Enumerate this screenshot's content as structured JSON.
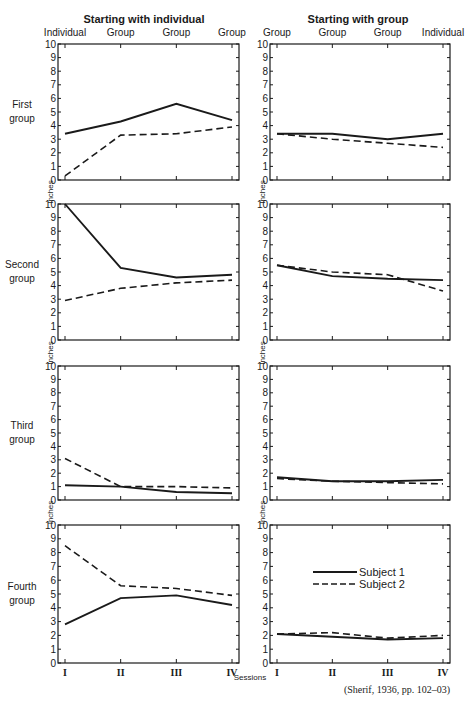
{
  "headers": {
    "left": "Starting with individual",
    "right": "Starting with group"
  },
  "columns": {
    "left": [
      "Individual",
      "Group",
      "Group",
      "Group"
    ],
    "right": [
      "Group",
      "Group",
      "Group",
      "Individual"
    ]
  },
  "group_labels": [
    [
      "First",
      "group"
    ],
    [
      "Second",
      "group"
    ],
    [
      "Third",
      "group"
    ],
    [
      "Fourth",
      "group"
    ]
  ],
  "y_axis_label": "Inches",
  "x_axis_label": "Sessions",
  "x_ticks": [
    "I",
    "II",
    "III",
    "IV"
  ],
  "y_ticks": [
    "0",
    "1",
    "2",
    "3",
    "4",
    "5",
    "6",
    "7",
    "8",
    "9",
    "10"
  ],
  "legend": {
    "subject1": "Subject 1",
    "subject2": "Subject 2"
  },
  "citation": "(Sherif, 1936, pp. 102–03)",
  "chart_data": [
    {
      "type": "line",
      "title": "First group — Starting with individual",
      "categories": [
        "I",
        "II",
        "III",
        "IV"
      ],
      "xlabel": "Sessions",
      "ylabel": "Inches",
      "ylim": [
        0,
        10
      ],
      "series": [
        {
          "name": "Subject 1",
          "values": [
            3.4,
            4.3,
            5.6,
            4.4
          ]
        },
        {
          "name": "Subject 2",
          "values": [
            0.3,
            3.3,
            3.4,
            3.9
          ]
        }
      ]
    },
    {
      "type": "line",
      "title": "First group — Starting with group",
      "categories": [
        "I",
        "II",
        "III",
        "IV"
      ],
      "xlabel": "Sessions",
      "ylabel": "Inches",
      "ylim": [
        0,
        10
      ],
      "series": [
        {
          "name": "Subject 1",
          "values": [
            3.4,
            3.4,
            3.0,
            3.4
          ]
        },
        {
          "name": "Subject 2",
          "values": [
            3.4,
            3.0,
            2.7,
            2.4
          ]
        }
      ]
    },
    {
      "type": "line",
      "title": "Second group — Starting with individual",
      "categories": [
        "I",
        "II",
        "III",
        "IV"
      ],
      "xlabel": "Sessions",
      "ylabel": "Inches",
      "ylim": [
        0,
        10
      ],
      "series": [
        {
          "name": "Subject 1",
          "values": [
            10.0,
            5.3,
            4.6,
            4.8
          ]
        },
        {
          "name": "Subject 2",
          "values": [
            2.9,
            3.8,
            4.2,
            4.4
          ]
        }
      ]
    },
    {
      "type": "line",
      "title": "Second group — Starting with group",
      "categories": [
        "I",
        "II",
        "III",
        "IV"
      ],
      "xlabel": "Sessions",
      "ylabel": "Inches",
      "ylim": [
        0,
        10
      ],
      "series": [
        {
          "name": "Subject 1",
          "values": [
            5.5,
            4.7,
            4.5,
            4.4
          ]
        },
        {
          "name": "Subject 2",
          "values": [
            5.5,
            5.0,
            4.8,
            3.6
          ]
        }
      ]
    },
    {
      "type": "line",
      "title": "Third group — Starting with individual",
      "categories": [
        "I",
        "II",
        "III",
        "IV"
      ],
      "xlabel": "Sessions",
      "ylabel": "Inches",
      "ylim": [
        0,
        10
      ],
      "series": [
        {
          "name": "Subject 1",
          "values": [
            1.1,
            1.0,
            0.6,
            0.5
          ]
        },
        {
          "name": "Subject 2",
          "values": [
            3.1,
            1.0,
            1.0,
            0.9
          ]
        }
      ]
    },
    {
      "type": "line",
      "title": "Third group — Starting with group",
      "categories": [
        "I",
        "II",
        "III",
        "IV"
      ],
      "xlabel": "Sessions",
      "ylabel": "Inches",
      "ylim": [
        0,
        10
      ],
      "series": [
        {
          "name": "Subject 1",
          "values": [
            1.7,
            1.4,
            1.4,
            1.5
          ]
        },
        {
          "name": "Subject 2",
          "values": [
            1.6,
            1.4,
            1.3,
            1.2
          ]
        }
      ]
    },
    {
      "type": "line",
      "title": "Fourth group — Starting with individual",
      "categories": [
        "I",
        "II",
        "III",
        "IV"
      ],
      "xlabel": "Sessions",
      "ylabel": "Inches",
      "ylim": [
        0,
        10
      ],
      "series": [
        {
          "name": "Subject 1",
          "values": [
            2.8,
            4.7,
            4.9,
            4.2
          ]
        },
        {
          "name": "Subject 2",
          "values": [
            8.5,
            5.6,
            5.4,
            4.9
          ]
        }
      ]
    },
    {
      "type": "line",
      "title": "Fourth group — Starting with group",
      "categories": [
        "I",
        "II",
        "III",
        "IV"
      ],
      "xlabel": "Sessions",
      "ylabel": "Inches",
      "ylim": [
        0,
        10
      ],
      "series": [
        {
          "name": "Subject 1",
          "values": [
            2.1,
            1.9,
            1.7,
            1.8
          ]
        },
        {
          "name": "Subject 2",
          "values": [
            2.1,
            2.2,
            1.8,
            2.0
          ]
        }
      ]
    }
  ]
}
